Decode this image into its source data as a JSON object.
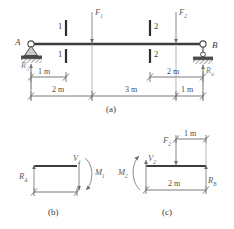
{
  "figure": {
    "title_panels": [
      "(a)",
      "(b)",
      "(c)"
    ],
    "panel_a": {
      "label": "(a)",
      "supports": {
        "left": {
          "point_label": "A",
          "reaction_label": "R",
          "reaction_sub": "A",
          "type": "pin-support"
        },
        "right": {
          "point_label": "B",
          "reaction_label": "R",
          "reaction_sub": "B",
          "type": "roller-support"
        }
      },
      "forces": [
        {
          "label": "F",
          "sub": "1",
          "direction": "down"
        },
        {
          "label": "F",
          "sub": "2",
          "direction": "down"
        }
      ],
      "section_marks": [
        {
          "label": "1",
          "position": "above-beam"
        },
        {
          "label": "1",
          "position": "below-beam"
        },
        {
          "label": "2",
          "position": "above-beam"
        },
        {
          "label": "2",
          "position": "below-beam"
        }
      ],
      "dimensions_upper": [
        {
          "value": "1 m"
        },
        {
          "value": "2 m"
        }
      ],
      "dimensions_lower": [
        {
          "value": "2 m"
        },
        {
          "value": "3 m"
        },
        {
          "value": "1 m"
        }
      ]
    },
    "panel_b": {
      "label": "(b)",
      "reaction": {
        "label": "R",
        "sub": "A",
        "direction": "up"
      },
      "shear": {
        "label": "V",
        "sub": "1",
        "direction": "down"
      },
      "moment": {
        "label": "M",
        "sub": "1",
        "sense": "clockwise"
      }
    },
    "panel_c": {
      "label": "(c)",
      "moment": {
        "label": "M",
        "sub": "2",
        "sense": "counter-clockwise"
      },
      "shear": {
        "label": "V",
        "sub": "2",
        "direction": "up"
      },
      "force": {
        "label": "F",
        "sub": "2",
        "direction": "down"
      },
      "reaction": {
        "label": "R",
        "sub": "B",
        "direction": "up"
      },
      "dimensions": [
        {
          "value": "1 m"
        },
        {
          "value": "2 m"
        }
      ]
    }
  }
}
